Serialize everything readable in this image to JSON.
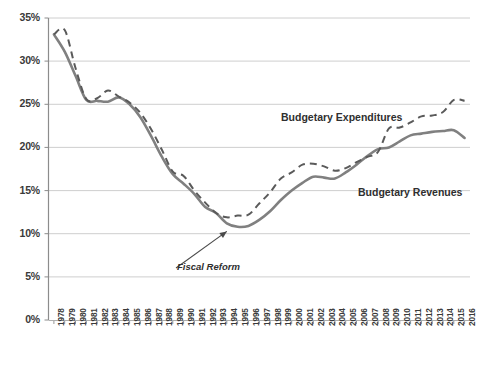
{
  "chart_data": {
    "type": "line",
    "title": "",
    "xlabel": "",
    "ylabel": "",
    "ylim": [
      0,
      35
    ],
    "ytick_values": [
      0,
      5,
      10,
      15,
      20,
      25,
      30,
      35
    ],
    "ytick_labels": [
      "0%",
      "5%",
      "10%",
      "15%",
      "20%",
      "25%",
      "30%",
      "35%"
    ],
    "grid": true,
    "legend_position": "inline-annotations",
    "x": [
      1978,
      1979,
      1980,
      1981,
      1982,
      1983,
      1984,
      1985,
      1986,
      1987,
      1988,
      1989,
      1990,
      1991,
      1992,
      1993,
      1994,
      1995,
      1996,
      1997,
      1998,
      1999,
      2000,
      2001,
      2002,
      2003,
      2004,
      2005,
      2006,
      2007,
      2008,
      2009,
      2010,
      2011,
      2012,
      2013,
      2014,
      2015,
      2016
    ],
    "xtick_labels": [
      "1978",
      "1979",
      "1980",
      "1981",
      "1982",
      "1983",
      "1984",
      "1985",
      "1986",
      "1987",
      "1988",
      "1989",
      "1990",
      "1991",
      "1992",
      "1993",
      "1994",
      "1995",
      "1996",
      "1997",
      "1998",
      "1999",
      "2000",
      "2001",
      "2002",
      "2003",
      "2004",
      "2005",
      "2006",
      "2007",
      "2008",
      "2009",
      "2010",
      "2011",
      "2012",
      "2013",
      "2014",
      "2015",
      "2016"
    ],
    "series": [
      {
        "name": "Budgetary Expenditures",
        "style": "dashed",
        "color": "#5a5a5a",
        "values": [
          33.1,
          33.6,
          29.2,
          25.6,
          25.7,
          26.6,
          25.9,
          25.2,
          24.0,
          22.1,
          19.7,
          17.2,
          16.7,
          15.0,
          13.6,
          12.4,
          11.9,
          12.1,
          12.2,
          13.5,
          14.8,
          16.4,
          17.1,
          18.0,
          18.1,
          17.8,
          17.3,
          17.6,
          18.3,
          18.9,
          19.5,
          22.2,
          22.3,
          22.9,
          23.6,
          23.7,
          24.1,
          25.5,
          25.4
        ]
      },
      {
        "name": "Budgetary Revenues",
        "style": "solid",
        "color": "#808080",
        "values": [
          33.1,
          31.1,
          28.3,
          25.5,
          25.4,
          25.3,
          25.8,
          25.0,
          23.5,
          21.3,
          18.9,
          16.9,
          15.8,
          14.6,
          13.1,
          12.4,
          11.2,
          10.8,
          10.9,
          11.6,
          12.6,
          13.9,
          15.0,
          15.9,
          16.6,
          16.5,
          16.4,
          17.1,
          18.0,
          19.0,
          19.8,
          20.0,
          20.7,
          21.4,
          21.6,
          21.8,
          21.9,
          22.0,
          21.1
        ]
      }
    ],
    "annotations": [
      {
        "id": "expenditures-label",
        "text": "Budgetary Expenditures",
        "style": "bold"
      },
      {
        "id": "revenues-label",
        "text": "Budgetary Revenues",
        "style": "bold"
      },
      {
        "id": "fiscal-reform-label",
        "text": "Fiscal Reform",
        "style": "bold-italic",
        "has_arrow": true,
        "points_at_year": 1994
      }
    ],
    "colors": {
      "grid": "#c8c8c8",
      "axis": "#8c8c8c",
      "text": "#3a3a3a",
      "solid_series": "#808080",
      "dashed_series": "#5a5a5a"
    }
  }
}
